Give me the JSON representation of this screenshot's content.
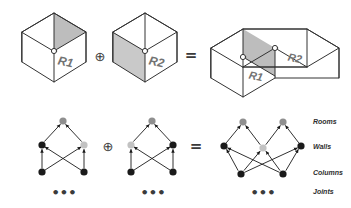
{
  "figure": {
    "title_shown": false,
    "background": "#ffffff",
    "stroke": "#333333",
    "colors": {
      "outline": "#333333",
      "slab_fill": "#bdbdbd",
      "wall_fill": "#c9c9c9",
      "room_node": "#8f8f8f",
      "shared_wall_node": "#c2c2c2",
      "solid_node": "#1a1a1a",
      "label_text": "#2e2e2e",
      "cube_label_text": "#737373"
    }
  },
  "operators": {
    "plus_symbol": "⊕",
    "equals_symbol": "=",
    "ellipsis": "•••"
  },
  "top_row": {
    "operands": [
      {
        "id": "cube-r1",
        "label": "R1",
        "shaded_part": "top-slab"
      },
      {
        "id": "cube-r2",
        "label": "R2",
        "shaded_part": "left-wall"
      }
    ],
    "result": {
      "id": "cube-merged",
      "labels": [
        "R1",
        "R2"
      ],
      "shaded_part": "shared-wall-slab"
    }
  },
  "bottom_row": {
    "row_labels": [
      "Rooms",
      "Walls",
      "Columns",
      "Joints"
    ],
    "graphs": [
      {
        "id": "graph-r1",
        "nodes": [
          {
            "id": "g1-room",
            "level": "Rooms",
            "color": "#8f8f8f",
            "cx": 63,
            "cy": 121,
            "r": 3.6
          },
          {
            "id": "g1-wallL",
            "level": "Walls",
            "color": "#1a1a1a",
            "cx": 42,
            "cy": 145,
            "r": 3.6
          },
          {
            "id": "g1-wallR",
            "level": "Walls",
            "color": "#c2c2c2",
            "cx": 84,
            "cy": 145,
            "r": 3.6
          },
          {
            "id": "g1-colL",
            "level": "Columns",
            "color": "#1a1a1a",
            "cx": 42,
            "cy": 172,
            "r": 3.6
          },
          {
            "id": "g1-colR",
            "level": "Columns",
            "color": "#1a1a1a",
            "cx": 84,
            "cy": 172,
            "r": 3.6
          }
        ],
        "edges": [
          [
            "g1-wallL",
            "g1-room"
          ],
          [
            "g1-wallR",
            "g1-room"
          ],
          [
            "g1-colL",
            "g1-wallL"
          ],
          [
            "g1-colR",
            "g1-wallR"
          ],
          [
            "g1-colL",
            "g1-wallR"
          ],
          [
            "g1-colR",
            "g1-wallL"
          ]
        ],
        "ellipsis": "•••"
      },
      {
        "id": "graph-r2",
        "nodes": [
          {
            "id": "g2-room",
            "level": "Rooms",
            "color": "#8f8f8f",
            "cx": 152,
            "cy": 121,
            "r": 3.6
          },
          {
            "id": "g2-wallL",
            "level": "Walls",
            "color": "#c2c2c2",
            "cx": 131,
            "cy": 145,
            "r": 3.6
          },
          {
            "id": "g2-wallR",
            "level": "Walls",
            "color": "#1a1a1a",
            "cx": 173,
            "cy": 145,
            "r": 3.6
          },
          {
            "id": "g2-colL",
            "level": "Columns",
            "color": "#1a1a1a",
            "cx": 131,
            "cy": 172,
            "r": 3.6
          },
          {
            "id": "g2-colR",
            "level": "Columns",
            "color": "#1a1a1a",
            "cx": 173,
            "cy": 172,
            "r": 3.6
          }
        ],
        "edges": [
          [
            "g2-wallL",
            "g2-room"
          ],
          [
            "g2-wallR",
            "g2-room"
          ],
          [
            "g2-colL",
            "g2-wallL"
          ],
          [
            "g2-colR",
            "g2-wallR"
          ],
          [
            "g2-colL",
            "g2-wallR"
          ],
          [
            "g2-colR",
            "g2-wallL"
          ]
        ],
        "ellipsis": "•••"
      }
    ],
    "result_graph": {
      "id": "graph-merged",
      "nodes": [
        {
          "id": "gm-roomL",
          "level": "Rooms",
          "color": "#8f8f8f",
          "cx": 243,
          "cy": 122,
          "r": 3.6
        },
        {
          "id": "gm-roomR",
          "level": "Rooms",
          "color": "#8f8f8f",
          "cx": 283,
          "cy": 122,
          "r": 3.6
        },
        {
          "id": "gm-wallL",
          "level": "Walls",
          "color": "#1a1a1a",
          "cx": 224,
          "cy": 146,
          "r": 3.6
        },
        {
          "id": "gm-wallC",
          "level": "Walls",
          "color": "#c2c2c2",
          "cx": 263,
          "cy": 148,
          "r": 3.6
        },
        {
          "id": "gm-wallR",
          "level": "Walls",
          "color": "#1a1a1a",
          "cx": 301,
          "cy": 146,
          "r": 3.6
        },
        {
          "id": "gm-colL",
          "level": "Columns",
          "color": "#1a1a1a",
          "cx": 241,
          "cy": 174,
          "r": 3.6
        },
        {
          "id": "gm-colR",
          "level": "Columns",
          "color": "#1a1a1a",
          "cx": 283,
          "cy": 174,
          "r": 3.6
        }
      ],
      "edges": [
        [
          "gm-wallL",
          "gm-roomL"
        ],
        [
          "gm-wallC",
          "gm-roomL"
        ],
        [
          "gm-wallC",
          "gm-roomR"
        ],
        [
          "gm-wallR",
          "gm-roomR"
        ],
        [
          "gm-colL",
          "gm-wallL"
        ],
        [
          "gm-colL",
          "gm-wallC"
        ],
        [
          "gm-colR",
          "gm-wallC"
        ],
        [
          "gm-colR",
          "gm-wallR"
        ],
        [
          "gm-colL",
          "gm-wallR"
        ],
        [
          "gm-colR",
          "gm-wallL"
        ]
      ],
      "ellipsis": "•••"
    }
  }
}
